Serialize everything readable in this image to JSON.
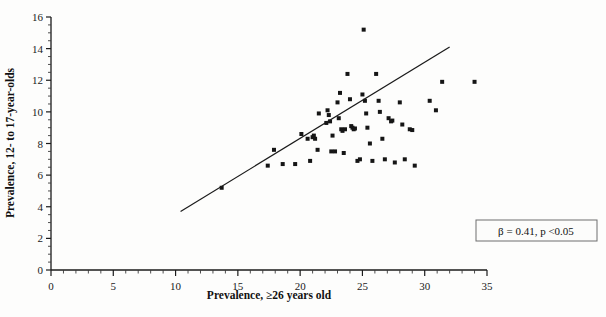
{
  "chart_data": {
    "type": "scatter",
    "title": "",
    "xlabel": "Prevalence, ≥26 years old",
    "ylabel": "Prevalence, 12- to 17-year-olds",
    "xlim": [
      0,
      35
    ],
    "ylim": [
      0,
      16
    ],
    "xticks": [
      0,
      5,
      10,
      15,
      20,
      25,
      30,
      35
    ],
    "yticks": [
      0,
      2,
      4,
      6,
      8,
      10,
      12,
      14,
      16
    ],
    "xtick_labels": [
      "0",
      "5",
      "10",
      "15",
      "20",
      "25",
      "30",
      "35"
    ],
    "ytick_labels": [
      "0",
      "2",
      "4",
      "6",
      "8",
      "10",
      "12",
      "14",
      "16"
    ],
    "x_minor_tick_interval": 1,
    "y_minor_tick_interval": 0.5,
    "grid": false,
    "legend": null,
    "annotations": [
      {
        "name": "regression-stats",
        "text": "β = 0.41, p <0.05",
        "x": 30.8,
        "y": 2.6,
        "boxed": true
      }
    ],
    "series": [
      {
        "name": "states",
        "marker": "square",
        "marker_size": 4,
        "color": "#151515",
        "points": [
          [
            13.7,
            5.2
          ],
          [
            17.4,
            6.6
          ],
          [
            18.6,
            6.7
          ],
          [
            17.9,
            7.6
          ],
          [
            19.6,
            6.7
          ],
          [
            20.1,
            8.6
          ],
          [
            20.6,
            8.3
          ],
          [
            21.0,
            8.4
          ],
          [
            21.1,
            8.5
          ],
          [
            21.2,
            8.3
          ],
          [
            20.8,
            6.9
          ],
          [
            21.5,
            9.9
          ],
          [
            21.4,
            7.6
          ],
          [
            22.2,
            10.1
          ],
          [
            22.3,
            9.8
          ],
          [
            22.1,
            9.3
          ],
          [
            22.4,
            9.4
          ],
          [
            22.6,
            8.5
          ],
          [
            22.5,
            7.5
          ],
          [
            22.8,
            7.5
          ],
          [
            23.0,
            10.6
          ],
          [
            23.2,
            11.2
          ],
          [
            23.1,
            9.6
          ],
          [
            23.3,
            8.9
          ],
          [
            23.4,
            8.8
          ],
          [
            23.6,
            8.9
          ],
          [
            23.5,
            7.4
          ],
          [
            23.8,
            12.4
          ],
          [
            24.0,
            10.8
          ],
          [
            24.1,
            9.1
          ],
          [
            24.2,
            9.0
          ],
          [
            24.3,
            8.9
          ],
          [
            24.4,
            8.95
          ],
          [
            24.6,
            6.9
          ],
          [
            24.8,
            7.0
          ],
          [
            25.1,
            15.2
          ],
          [
            25.0,
            11.1
          ],
          [
            25.2,
            10.7
          ],
          [
            25.3,
            9.9
          ],
          [
            25.4,
            9.0
          ],
          [
            25.6,
            8.0
          ],
          [
            25.8,
            6.9
          ],
          [
            26.1,
            12.4
          ],
          [
            26.3,
            10.7
          ],
          [
            26.4,
            10.0
          ],
          [
            26.6,
            8.3
          ],
          [
            26.8,
            7.0
          ],
          [
            27.1,
            9.6
          ],
          [
            27.3,
            9.4
          ],
          [
            27.4,
            9.45
          ],
          [
            27.6,
            6.8
          ],
          [
            28.0,
            10.6
          ],
          [
            28.2,
            9.2
          ],
          [
            28.4,
            7.0
          ],
          [
            28.8,
            8.9
          ],
          [
            29.0,
            8.85
          ],
          [
            29.2,
            6.6
          ],
          [
            30.4,
            10.7
          ],
          [
            30.9,
            10.1
          ],
          [
            31.4,
            11.9
          ],
          [
            34.0,
            11.9
          ]
        ]
      }
    ],
    "fit_line": {
      "name": "regression-line",
      "x_start": 10.4,
      "y_start": 3.7,
      "x_end": 32.0,
      "y_end": 14.1,
      "slope": 0.41,
      "p_value": "<0.05"
    }
  }
}
